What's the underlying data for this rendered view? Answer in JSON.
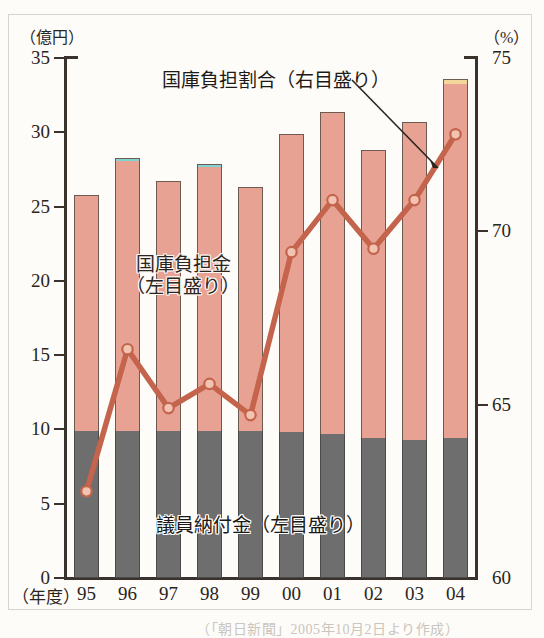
{
  "figure": {
    "top_cut_text": "",
    "source_note": "（「朝日新聞」2005年10月2日より作成）"
  },
  "axes": {
    "left_unit": "（億円）",
    "right_unit": "（%）",
    "x_unit": "（年度）",
    "left_ticks": [
      "0",
      "5",
      "10",
      "15",
      "20",
      "25",
      "30",
      "35"
    ],
    "right_ticks": [
      "60",
      "65",
      "70",
      "75"
    ],
    "x_ticks": [
      "95",
      "96",
      "97",
      "98",
      "99",
      "00",
      "01",
      "02",
      "03",
      "04"
    ]
  },
  "annotations": {
    "ratio_label": "国庫負担割合（右目盛り）",
    "kokko_label_line1": "国庫負担金",
    "kokko_label_line2": "（左目盛り）",
    "giin_label": "議員納付金（左目盛り）"
  },
  "colors": {
    "bar_top": "#e8a294",
    "bar_bottom": "#6e6e6e",
    "line": "#c4644c",
    "marker_fill": "#f3c3b2",
    "cap_teal": "#7fd4d4",
    "cap_cream": "#f3d79a",
    "axis": "#3a332d",
    "page": "#fdfcf9"
  },
  "chart_data": {
    "type": "bar",
    "title": "",
    "xlabel": "（年度）",
    "ylabel": "（億円）",
    "y2label": "（%）",
    "ylim": [
      0,
      35
    ],
    "y2lim": [
      60,
      75
    ],
    "grid": false,
    "legend_position": "in-plot",
    "categories": [
      "95",
      "96",
      "97",
      "98",
      "99",
      "00",
      "01",
      "02",
      "03",
      "04"
    ],
    "series": [
      {
        "name": "議員納付金（左目盛り）",
        "axis": "left",
        "kind": "bar-stack-bottom",
        "values": [
          9.9,
          9.9,
          9.9,
          9.9,
          9.9,
          9.8,
          9.7,
          9.4,
          9.3,
          9.4
        ]
      },
      {
        "name": "国庫負担金（左目盛り）",
        "axis": "left",
        "kind": "bar-stack-top",
        "values": [
          15.9,
          18.4,
          16.8,
          18.0,
          16.4,
          20.1,
          21.7,
          19.4,
          21.4,
          24.2
        ]
      },
      {
        "name": "合計（積み上げ）",
        "axis": "left",
        "kind": "bar-total",
        "values": [
          25.8,
          28.3,
          26.7,
          27.9,
          26.3,
          29.9,
          31.4,
          28.8,
          30.7,
          33.6
        ]
      },
      {
        "name": "国庫負担割合（右目盛り）",
        "axis": "right",
        "kind": "line",
        "values": [
          62.5,
          66.6,
          64.9,
          65.6,
          64.7,
          69.4,
          70.9,
          69.5,
          70.9,
          72.8
        ]
      }
    ],
    "bar_caps": [
      {
        "index": 1,
        "color": "#7fd4d4",
        "height": 0.18
      },
      {
        "index": 3,
        "color": "#7fd4d4",
        "height": 0.18
      },
      {
        "index": 9,
        "color": "#f3d79a",
        "height": 0.3
      }
    ]
  }
}
